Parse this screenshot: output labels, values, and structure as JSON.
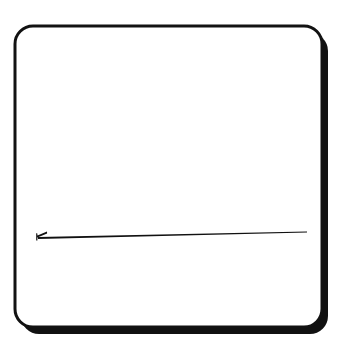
{
  "canvas": {
    "width": 346,
    "height": 343,
    "background_color": "#FFFFFF",
    "title": "Needle pictogram"
  },
  "card": {
    "name": "rounded-rectangle-frame",
    "x": 15,
    "y": 26,
    "width": 307,
    "height": 301,
    "corner_radius": 18,
    "fill_color": "#FFFFFF",
    "stroke_color": "#121212",
    "stroke_width_thin": 3,
    "shadow": {
      "name": "drop-shadow",
      "color": "#111111",
      "offset_x": 6,
      "offset_y": 7,
      "edges": "right-and-bottom"
    }
  },
  "needle": {
    "name": "needle-shape",
    "color": "#111111",
    "stroke_width": 2,
    "start_x": 38,
    "start_y": 238,
    "end_x": 307,
    "end_y": 232,
    "eye": {
      "name": "needle-eye-fork",
      "x": 38,
      "y": 234,
      "fork_length": 9,
      "fork_spread": 6
    }
  }
}
